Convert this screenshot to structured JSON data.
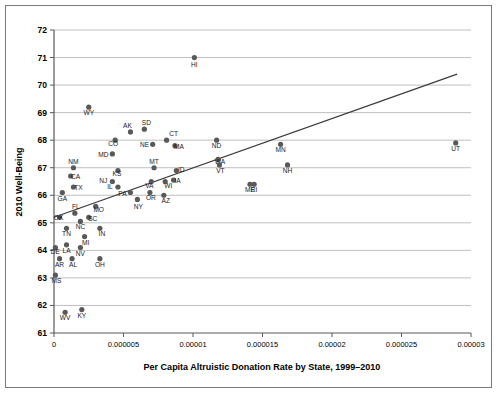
{
  "chart_data": {
    "type": "scatter",
    "title": "",
    "xlabel": "Per Capita Altruistic Donation Rate by State, 1999–2010",
    "ylabel": "2010 Well-Being",
    "xlim": [
      0,
      3e-05
    ],
    "ylim": [
      61,
      72
    ],
    "xticks": [
      "0",
      "0.000005",
      "0.00001",
      "0.000015",
      "0.00002",
      "0.000025",
      "0.00003"
    ],
    "xtick_values": [
      0,
      5e-06,
      1e-05,
      1.5e-05,
      2e-05,
      2.5e-05,
      3e-05
    ],
    "yticks": [
      "61",
      "62",
      "63",
      "64",
      "65",
      "66",
      "67",
      "68",
      "69",
      "70",
      "71",
      "72"
    ],
    "ytick_values": [
      61,
      62,
      63,
      64,
      65,
      66,
      67,
      68,
      69,
      70,
      71,
      72
    ],
    "grid": "horizontal",
    "legend": "none",
    "marker_color": "#595959",
    "trendline_color": "#3a3a3a",
    "trendline": {
      "x0": 0.0,
      "y0": 65.2,
      "x1": 2.9e-05,
      "y1": 70.4
    },
    "points": [
      {
        "label": "HI",
        "x": 1.01e-05,
        "y": 71.0,
        "lx": 0,
        "ly": 9
      },
      {
        "label": "WY",
        "x": 2.5e-06,
        "y": 69.2,
        "lx": 0,
        "ly": 8
      },
      {
        "label": "SD",
        "x": 6.5e-06,
        "y": 68.4,
        "lx": 2,
        "ly": -4
      },
      {
        "label": "AK",
        "x": 5.5e-06,
        "y": 68.3,
        "lx": -3,
        "ly": -4
      },
      {
        "label": "CT",
        "x": 8.1e-06,
        "y": 68.0,
        "lx": 7,
        "ly": -4
      },
      {
        "label": "CO",
        "x": 4.4e-06,
        "y": 68.0,
        "lx": -2,
        "ly": 6
      },
      {
        "label": "ND",
        "x": 1.17e-05,
        "y": 68.0,
        "lx": 0,
        "ly": 8
      },
      {
        "label": "NE",
        "x": 7.1e-06,
        "y": 67.85,
        "lx": -8,
        "ly": 3
      },
      {
        "label": "MA",
        "x": 8.7e-06,
        "y": 67.8,
        "lx": 4,
        "ly": 3
      },
      {
        "label": "MN",
        "x": 1.63e-05,
        "y": 67.85,
        "lx": 0,
        "ly": 8
      },
      {
        "label": "UT",
        "x": 2.89e-05,
        "y": 67.9,
        "lx": 0,
        "ly": 8
      },
      {
        "label": "MD",
        "x": 4.2e-06,
        "y": 67.5,
        "lx": -9,
        "ly": 3
      },
      {
        "label": "WA",
        "x": 1.18e-05,
        "y": 67.3,
        "lx": 2,
        "ly": 5
      },
      {
        "label": "NM",
        "x": 1.4e-06,
        "y": 67.0,
        "lx": 0,
        "ly": -4
      },
      {
        "label": "ID",
        "x": 8.8e-06,
        "y": 66.9,
        "lx": 5,
        "ly": 2
      },
      {
        "label": "MT",
        "x": 7.2e-06,
        "y": 67.0,
        "lx": 0,
        "ly": -4
      },
      {
        "label": "KS",
        "x": 4.6e-06,
        "y": 66.9,
        "lx": -1,
        "ly": 6
      },
      {
        "label": "VT",
        "x": 1.19e-05,
        "y": 67.1,
        "lx": 1,
        "ly": 8
      },
      {
        "label": "NH",
        "x": 1.68e-05,
        "y": 67.1,
        "lx": 0,
        "ly": 8
      },
      {
        "label": "CA",
        "x": 1.2e-06,
        "y": 66.7,
        "lx": 5,
        "ly": 3
      },
      {
        "label": "NJ",
        "x": 4.2e-06,
        "y": 66.5,
        "lx": -9,
        "ly": 1
      },
      {
        "label": "VA",
        "x": 7e-06,
        "y": 66.5,
        "lx": -2,
        "ly": 6
      },
      {
        "label": "WI",
        "x": 8e-06,
        "y": 66.5,
        "lx": 3,
        "ly": 6
      },
      {
        "label": "IA",
        "x": 8.6e-06,
        "y": 66.55,
        "lx": 4,
        "ly": 3
      },
      {
        "label": "TX",
        "x": 1.4e-06,
        "y": 66.3,
        "lx": 5,
        "ly": 3
      },
      {
        "label": "IL",
        "x": 4.6e-06,
        "y": 66.3,
        "lx": -8,
        "ly": 2
      },
      {
        "label": "ME",
        "x": 1.41e-05,
        "y": 66.4,
        "lx": 0,
        "ly": 8
      },
      {
        "label": "RI",
        "x": 1.44e-05,
        "y": 66.4,
        "lx": 0,
        "ly": 8
      },
      {
        "label": "GA",
        "x": 6e-07,
        "y": 66.1,
        "lx": 0,
        "ly": 8
      },
      {
        "label": "PA",
        "x": 5.5e-06,
        "y": 66.1,
        "lx": -8,
        "ly": 3
      },
      {
        "label": "OR",
        "x": 6.9e-06,
        "y": 66.1,
        "lx": 1,
        "ly": 7
      },
      {
        "label": "AZ",
        "x": 7.9e-06,
        "y": 66.0,
        "lx": 2,
        "ly": 8
      },
      {
        "label": "NY",
        "x": 6e-06,
        "y": 65.85,
        "lx": 1,
        "ly": 10
      },
      {
        "label": "MO",
        "x": 3e-06,
        "y": 65.6,
        "lx": 3,
        "ly": 6
      },
      {
        "label": "FL",
        "x": 1.5e-06,
        "y": 65.35,
        "lx": 1,
        "ly": -4
      },
      {
        "label": "OK",
        "x": 4e-07,
        "y": 65.2,
        "lx": -1,
        "ly": 3
      },
      {
        "label": "SC",
        "x": 2.5e-06,
        "y": 65.2,
        "lx": 4,
        "ly": 4
      },
      {
        "label": "NC",
        "x": 1.9e-06,
        "y": 65.05,
        "lx": 0,
        "ly": 8
      },
      {
        "label": "TN",
        "x": 9e-07,
        "y": 64.8,
        "lx": 0,
        "ly": 8
      },
      {
        "label": "IN",
        "x": 3.3e-06,
        "y": 64.8,
        "lx": 2,
        "ly": 8
      },
      {
        "label": "MI",
        "x": 2.2e-06,
        "y": 64.5,
        "lx": 1,
        "ly": 8
      },
      {
        "label": "LA",
        "x": 9e-07,
        "y": 64.2,
        "lx": 0,
        "ly": 8
      },
      {
        "label": "DE",
        "x": 1e-07,
        "y": 64.1,
        "lx": 0,
        "ly": 6
      },
      {
        "label": "NV",
        "x": 1.9e-06,
        "y": 64.1,
        "lx": 0,
        "ly": 8
      },
      {
        "label": "AR",
        "x": 4e-07,
        "y": 63.7,
        "lx": 0,
        "ly": 8
      },
      {
        "label": "AL",
        "x": 1.3e-06,
        "y": 63.7,
        "lx": 1,
        "ly": 8
      },
      {
        "label": "OH",
        "x": 3.3e-06,
        "y": 63.7,
        "lx": 0,
        "ly": 8
      },
      {
        "label": "MS",
        "x": 1e-07,
        "y": 63.1,
        "lx": 1,
        "ly": 8
      },
      {
        "label": "WV",
        "x": 8e-07,
        "y": 61.75,
        "lx": 0,
        "ly": 8
      },
      {
        "label": "KY",
        "x": 2e-06,
        "y": 61.85,
        "lx": 0,
        "ly": 8
      }
    ]
  }
}
